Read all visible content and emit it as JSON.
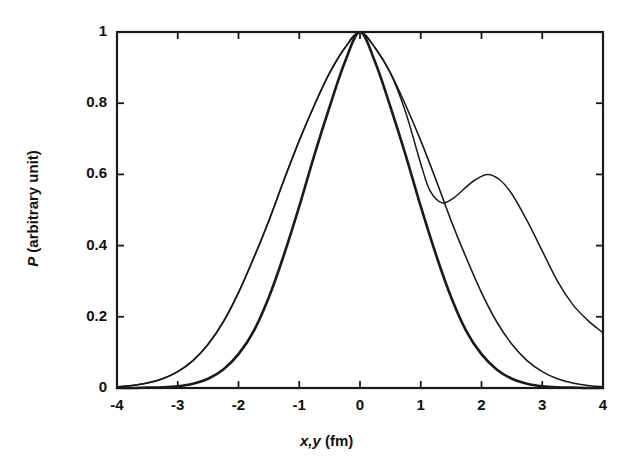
{
  "chart_data": {
    "type": "line",
    "title": "",
    "subtitle": "",
    "xlabel": "x,y (fm)",
    "xlabel_italic_part": "x,y",
    "xlabel_roman_part": " (fm)",
    "ylabel": "P (arbitrary unit)",
    "ylabel_italic_part": "P",
    "ylabel_roman_part": " (arbitrary unit)",
    "xlim": [
      -4,
      4
    ],
    "ylim": [
      0,
      1
    ],
    "grid": false,
    "legend": "none",
    "xticks": [
      -4,
      -3,
      -2,
      -1,
      0,
      1,
      2,
      3,
      4
    ],
    "xtick_labels": [
      "-4",
      "-3",
      "-2",
      "-1",
      "0",
      "1",
      "2",
      "3",
      "4"
    ],
    "yticks": [
      0,
      0.2,
      0.4,
      0.6,
      0.8,
      1
    ],
    "ytick_labels": [
      "0",
      "0.2",
      "0.4",
      "0.6",
      "0.8",
      "1"
    ],
    "tick_direction": "in",
    "line_color": "#1a1a1a",
    "frame_color": "#1a1a1a",
    "series": [
      {
        "name": "narrow-gaussian",
        "style": "solid-thick",
        "linewidth": 2.6,
        "x": [
          -4,
          -3.75,
          -3.5,
          -3.25,
          -3,
          -2.75,
          -2.5,
          -2.25,
          -2,
          -1.75,
          -1.5,
          -1.25,
          -1,
          -0.75,
          -0.5,
          -0.25,
          0,
          0.25,
          0.5,
          0.75,
          1,
          1.25,
          1.5,
          1.75,
          2,
          2.25,
          2.5,
          2.75,
          3,
          3.25,
          3.5,
          3.75,
          4
        ],
        "y": [
          0.0,
          0.0,
          0.001,
          0.002,
          0.005,
          0.012,
          0.026,
          0.052,
          0.095,
          0.16,
          0.255,
          0.375,
          0.51,
          0.655,
          0.79,
          0.915,
          1.0,
          0.915,
          0.79,
          0.655,
          0.51,
          0.375,
          0.255,
          0.16,
          0.095,
          0.052,
          0.026,
          0.012,
          0.005,
          0.002,
          0.001,
          0.0,
          0.0
        ]
      },
      {
        "name": "wide-gaussian",
        "style": "solid-thin",
        "linewidth": 1.6,
        "x": [
          -4,
          -3.75,
          -3.5,
          -3.25,
          -3,
          -2.75,
          -2.5,
          -2.25,
          -2,
          -1.75,
          -1.5,
          -1.25,
          -1,
          -0.75,
          -0.5,
          -0.25,
          0,
          0.25,
          0.5,
          0.75,
          1,
          1.25,
          1.5,
          1.75,
          2,
          2.25,
          2.5,
          2.75,
          3,
          3.25,
          3.5,
          3.75,
          4
        ],
        "y": [
          0.003,
          0.007,
          0.014,
          0.026,
          0.046,
          0.077,
          0.123,
          0.186,
          0.268,
          0.365,
          0.47,
          0.585,
          0.695,
          0.795,
          0.885,
          0.955,
          1.0,
          0.955,
          0.885,
          0.795,
          0.695,
          0.585,
          0.47,
          0.365,
          0.268,
          0.186,
          0.123,
          0.077,
          0.046,
          0.026,
          0.014,
          0.007,
          0.003
        ]
      },
      {
        "name": "bimodal-curve",
        "style": "solid-thin",
        "linewidth": 1.5,
        "x": [
          -4,
          -3.75,
          -3.5,
          -3.25,
          -3,
          -2.75,
          -2.5,
          -2.25,
          -2,
          -1.75,
          -1.5,
          -1.25,
          -1,
          -0.75,
          -0.5,
          -0.25,
          0,
          0.25,
          0.5,
          0.75,
          1,
          1.15,
          1.35,
          1.55,
          1.75,
          1.9,
          2.1,
          2.3,
          2.5,
          2.75,
          3,
          3.25,
          3.5,
          3.75,
          4
        ],
        "y": [
          0.003,
          0.007,
          0.014,
          0.026,
          0.046,
          0.077,
          0.123,
          0.186,
          0.268,
          0.365,
          0.47,
          0.585,
          0.695,
          0.795,
          0.885,
          0.955,
          1.0,
          0.955,
          0.885,
          0.775,
          0.63,
          0.555,
          0.52,
          0.535,
          0.565,
          0.585,
          0.6,
          0.585,
          0.545,
          0.47,
          0.385,
          0.3,
          0.235,
          0.19,
          0.155
        ]
      }
    ],
    "annotations": {
      "peak_value": 1.0,
      "peak_x": 0,
      "secondary_bump_peak_value": 0.6,
      "secondary_bump_peak_x": 2.1,
      "local_minimum_value": 0.52,
      "local_minimum_x": 1.35,
      "right_edge_value": 0.155
    }
  }
}
